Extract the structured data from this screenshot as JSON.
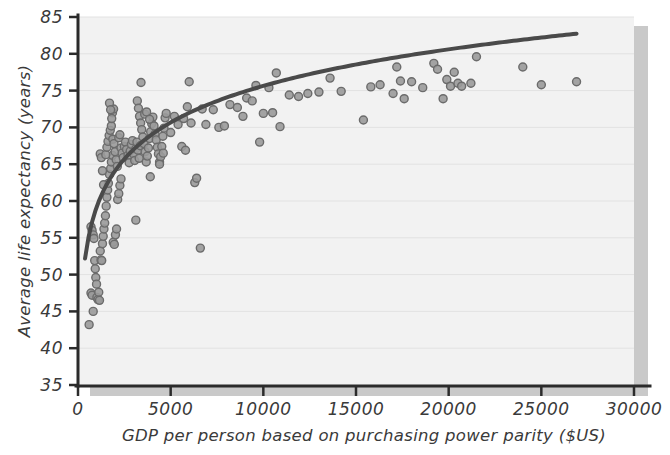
{
  "chart_data": {
    "type": "scatter",
    "title": "",
    "xlabel": "GDP per person based on purchasing power parity ($US)",
    "ylabel": "Average life expectancy (years)",
    "xlim": [
      0,
      30000
    ],
    "ylim": [
      35,
      85
    ],
    "xticks": [
      0,
      5000,
      10000,
      15000,
      20000,
      25000,
      30000
    ],
    "xtick_labels": [
      "0",
      "5000",
      "10000",
      "15000",
      "20000",
      "25000",
      "30000"
    ],
    "yticks": [
      35,
      40,
      45,
      50,
      55,
      60,
      65,
      70,
      75,
      80,
      85
    ],
    "ytick_labels": [
      "35",
      "40",
      "45",
      "50",
      "55",
      "60",
      "65",
      "70",
      "75",
      "80",
      "85"
    ],
    "grid": "horizontal",
    "legend": "none",
    "marker": {
      "shape": "circle",
      "fill_color": "#9a9a9a",
      "edge_color": "#6b6b6b",
      "size_px": 8
    },
    "trendline": {
      "label": "logarithmic fit",
      "color": "#4a4a4a",
      "width_px": 4,
      "form": "y = a + b*ln(x)",
      "a": 9.6,
      "b": 7.17,
      "x_start": 380,
      "x_end": 26900,
      "y_start": 49.0,
      "y_end": 80.6
    },
    "plot_background": "#f2f2f2",
    "gridline_color": "#e2e2e2",
    "axis_color": "#2b2b2b",
    "shadow_color": "#c9c9c9",
    "n_points": 175,
    "series": [
      {
        "name": "countries",
        "points": [
          [
            600,
            43.2
          ],
          [
            700,
            47.5
          ],
          [
            760,
            47.2
          ],
          [
            820,
            45.0
          ],
          [
            700,
            56.5
          ],
          [
            760,
            56.0
          ],
          [
            820,
            55.4
          ],
          [
            860,
            54.9
          ],
          [
            900,
            51.9
          ],
          [
            930,
            50.8
          ],
          [
            960,
            49.6
          ],
          [
            1000,
            48.7
          ],
          [
            1020,
            46.9
          ],
          [
            1080,
            46.6
          ],
          [
            1120,
            47.6
          ],
          [
            1160,
            46.5
          ],
          [
            1200,
            53.2
          ],
          [
            1240,
            52.0
          ],
          [
            1280,
            51.9
          ],
          [
            1320,
            54.2
          ],
          [
            1360,
            55.2
          ],
          [
            1400,
            56.2
          ],
          [
            1440,
            57.0
          ],
          [
            1480,
            58.0
          ],
          [
            1520,
            59.3
          ],
          [
            1560,
            60.5
          ],
          [
            1600,
            61.5
          ],
          [
            1640,
            62.4
          ],
          [
            1700,
            63.6
          ],
          [
            1760,
            64.4
          ],
          [
            1800,
            65.3
          ],
          [
            1860,
            66.2
          ],
          [
            1200,
            66.4
          ],
          [
            1260,
            65.9
          ],
          [
            1320,
            64.1
          ],
          [
            1380,
            62.2
          ],
          [
            1500,
            66.3
          ],
          [
            1560,
            67.3
          ],
          [
            1620,
            68.1
          ],
          [
            1680,
            68.9
          ],
          [
            1740,
            69.6
          ],
          [
            1800,
            70.2
          ],
          [
            1860,
            72.0
          ],
          [
            1920,
            72.5
          ],
          [
            1700,
            73.3
          ],
          [
            1760,
            72.4
          ],
          [
            1820,
            71.2
          ],
          [
            1880,
            68.4
          ],
          [
            1940,
            67.8
          ],
          [
            2000,
            66.7
          ],
          [
            2060,
            65.6
          ],
          [
            2120,
            64.7
          ],
          [
            1900,
            54.4
          ],
          [
            1960,
            54.1
          ],
          [
            2020,
            55.4
          ],
          [
            2080,
            56.2
          ],
          [
            2140,
            60.2
          ],
          [
            2200,
            61.0
          ],
          [
            2260,
            62.1
          ],
          [
            2320,
            63.0
          ],
          [
            2200,
            68.6
          ],
          [
            2260,
            69.0
          ],
          [
            2320,
            67.2
          ],
          [
            2380,
            66.5
          ],
          [
            2440,
            65.9
          ],
          [
            2500,
            67.4
          ],
          [
            2560,
            68.0
          ],
          [
            2620,
            67.0
          ],
          [
            2700,
            66.2
          ],
          [
            2760,
            65.2
          ],
          [
            2820,
            66.8
          ],
          [
            2880,
            67.7
          ],
          [
            2940,
            68.2
          ],
          [
            3000,
            66.4
          ],
          [
            3060,
            65.5
          ],
          [
            3120,
            67.1
          ],
          [
            3180,
            68.0
          ],
          [
            3240,
            66.9
          ],
          [
            3300,
            65.8
          ],
          [
            3360,
            67.5
          ],
          [
            3120,
            57.4
          ],
          [
            3200,
            73.6
          ],
          [
            3260,
            72.6
          ],
          [
            3320,
            71.5
          ],
          [
            3380,
            70.6
          ],
          [
            3440,
            69.7
          ],
          [
            3500,
            68.7
          ],
          [
            3560,
            67.8
          ],
          [
            3620,
            66.7
          ],
          [
            3680,
            65.3
          ],
          [
            3740,
            66.1
          ],
          [
            3800,
            67.2
          ],
          [
            3860,
            68.5
          ],
          [
            3920,
            69.4
          ],
          [
            3980,
            70.5
          ],
          [
            4040,
            71.4
          ],
          [
            3400,
            76.1
          ],
          [
            3600,
            71.8
          ],
          [
            3700,
            72.1
          ],
          [
            3860,
            71.1
          ],
          [
            4100,
            70.2
          ],
          [
            4160,
            69.1
          ],
          [
            4220,
            68.3
          ],
          [
            4280,
            67.3
          ],
          [
            4340,
            66.4
          ],
          [
            4400,
            65.3
          ],
          [
            4460,
            66.0
          ],
          [
            4520,
            67.4
          ],
          [
            4580,
            68.8
          ],
          [
            4640,
            69.9
          ],
          [
            4700,
            71.3
          ],
          [
            4760,
            71.9
          ],
          [
            3900,
            63.3
          ],
          [
            4400,
            65.0
          ],
          [
            4600,
            66.5
          ],
          [
            5000,
            69.3
          ],
          [
            5200,
            71.5
          ],
          [
            5400,
            70.4
          ],
          [
            5600,
            67.4
          ],
          [
            5700,
            71.2
          ],
          [
            5800,
            66.9
          ],
          [
            5900,
            72.8
          ],
          [
            6000,
            76.2
          ],
          [
            6100,
            70.6
          ],
          [
            6300,
            62.5
          ],
          [
            6400,
            63.1
          ],
          [
            6600,
            53.6
          ],
          [
            6700,
            72.5
          ],
          [
            6900,
            70.4
          ],
          [
            7300,
            72.4
          ],
          [
            7600,
            70.0
          ],
          [
            7900,
            70.2
          ],
          [
            8200,
            73.1
          ],
          [
            8600,
            72.7
          ],
          [
            8900,
            71.5
          ],
          [
            9100,
            74.0
          ],
          [
            9400,
            73.6
          ],
          [
            9600,
            75.7
          ],
          [
            9800,
            68.0
          ],
          [
            10000,
            71.9
          ],
          [
            10300,
            75.4
          ],
          [
            10500,
            72.0
          ],
          [
            10700,
            77.4
          ],
          [
            10900,
            70.1
          ],
          [
            11400,
            74.4
          ],
          [
            11900,
            74.2
          ],
          [
            12400,
            74.6
          ],
          [
            13000,
            74.8
          ],
          [
            13600,
            76.7
          ],
          [
            14200,
            74.9
          ],
          [
            15400,
            71.0
          ],
          [
            15800,
            75.5
          ],
          [
            16300,
            75.8
          ],
          [
            17000,
            74.6
          ],
          [
            17200,
            78.2
          ],
          [
            17400,
            76.3
          ],
          [
            17600,
            73.9
          ],
          [
            18000,
            76.2
          ],
          [
            18600,
            75.4
          ],
          [
            19200,
            78.7
          ],
          [
            19400,
            77.9
          ],
          [
            19700,
            73.9
          ],
          [
            19900,
            76.5
          ],
          [
            20100,
            75.6
          ],
          [
            20300,
            77.5
          ],
          [
            20500,
            76.0
          ],
          [
            20700,
            75.6
          ],
          [
            21200,
            76.0
          ],
          [
            21500,
            79.6
          ],
          [
            24000,
            78.2
          ],
          [
            25000,
            75.8
          ],
          [
            26900,
            76.2
          ]
        ]
      }
    ]
  }
}
